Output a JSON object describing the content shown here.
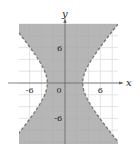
{
  "chart_data": {
    "type": "area",
    "title": "",
    "inequality": "x^2/9 - y^2/12.5 < 1",
    "xlabel": "x",
    "ylabel": "y",
    "xlim": [
      -8,
      9
    ],
    "ylim": [
      -10,
      10
    ],
    "grid": true,
    "grid_step": 2,
    "x_ticks": [
      {
        "value": -6,
        "label": "-6"
      },
      {
        "value": 0,
        "label": "0"
      },
      {
        "value": 6,
        "label": "6"
      }
    ],
    "y_ticks": [
      {
        "value": 6,
        "label": "6"
      },
      {
        "value": -6,
        "label": "-6"
      }
    ],
    "origin_label": "0",
    "boundary_style": "dashed",
    "vertices": [
      [
        -3,
        0
      ],
      [
        3,
        0
      ]
    ],
    "shade_color": "#a9a9a9",
    "boundary_color": "#777777",
    "grid_color": "#d8d8d8",
    "axis_color": "#666666"
  }
}
